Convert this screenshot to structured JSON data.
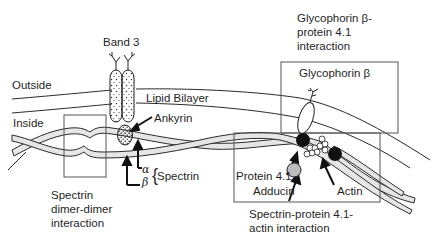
{
  "diagram": {
    "type": "biological-schematic",
    "labels": {
      "band3": "Band 3",
      "outside": "Outside",
      "inside": "Inside",
      "lipid_bilayer": "Lipid Bilayer",
      "ankyrin": "Ankyrin",
      "alpha": "α",
      "beta": "β",
      "spectrin": "Spectrin",
      "dimer_caption_1": "Spectrin",
      "dimer_caption_2": "dimer-dimer",
      "dimer_caption_3": "interaction",
      "glyco_title_1": "Glycophorin β-",
      "glyco_title_2": "protein 4.1",
      "glyco_title_3": "interaction",
      "glyco_box_label": "Glycophorin β",
      "protein41": "Protein 4.1",
      "adducin": "Adducin",
      "actin": "Actin",
      "actin_caption_1": "Spectrin-protein 4.1-",
      "actin_caption_2": "actin interaction"
    },
    "colors": {
      "line": "#2a2a2a",
      "filament_fill": "#e6e6e6",
      "dark_node": "#111111",
      "adducin_fill": "#bdbdbd",
      "background": "#ffffff"
    }
  }
}
